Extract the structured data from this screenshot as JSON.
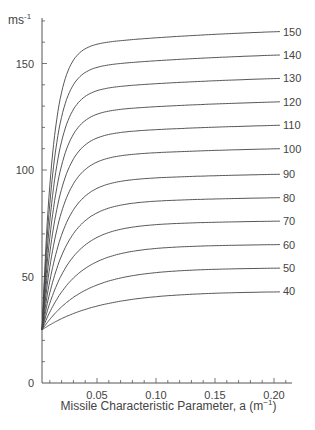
{
  "chart_data": {
    "type": "line",
    "title": "",
    "ylabel": "ms⁻¹",
    "ylabel_unit_base": "ms",
    "ylabel_unit_exp": "-1",
    "xlabel": "Missile Characteristic Parameter, a (m⁻¹)",
    "xlabel_base": "Missile Characteristic Parameter, a (m",
    "xlabel_exp": "−1",
    "xlabel_close": ")",
    "xlim": [
      0,
      0.22
    ],
    "ylim": [
      0,
      170
    ],
    "x_ticks": [
      "0.05",
      "0.10",
      "0.15",
      "0.20"
    ],
    "x_tick_values": [
      0.05,
      0.1,
      0.15,
      0.2
    ],
    "y_ticks": [
      "0",
      "50",
      "100",
      "150"
    ],
    "y_tick_values": [
      0,
      50,
      100,
      150
    ],
    "grid": false,
    "legend_position": "inline-right",
    "start_value": 25,
    "series": [
      {
        "name": "150",
        "asymptote": 150,
        "end_value": 165
      },
      {
        "name": "140",
        "asymptote": 140,
        "end_value": 154
      },
      {
        "name": "130",
        "asymptote": 130,
        "end_value": 143
      },
      {
        "name": "120",
        "asymptote": 120,
        "end_value": 132
      },
      {
        "name": "110",
        "asymptote": 110,
        "end_value": 121
      },
      {
        "name": "100",
        "asymptote": 100,
        "end_value": 110
      },
      {
        "name": "90",
        "asymptote": 90,
        "end_value": 98
      },
      {
        "name": "80",
        "asymptote": 80,
        "end_value": 87
      },
      {
        "name": "70",
        "asymptote": 70,
        "end_value": 76
      },
      {
        "name": "60",
        "asymptote": 60,
        "end_value": 65
      },
      {
        "name": "50",
        "asymptote": 50,
        "end_value": 54
      },
      {
        "name": "40",
        "asymptote": 40,
        "end_value": 43
      }
    ]
  }
}
